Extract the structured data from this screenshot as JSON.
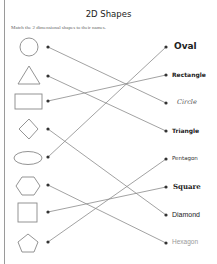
{
  "worksheet": {
    "title": "2D Shapes",
    "instructions": "Match the 2 dimensional shapes to their names."
  },
  "shapes": [
    {
      "name": "circle",
      "y": 47
    },
    {
      "name": "triangle",
      "y": 76
    },
    {
      "name": "rectangle",
      "y": 101
    },
    {
      "name": "diamond",
      "y": 129
    },
    {
      "name": "oval",
      "y": 157
    },
    {
      "name": "hexagon",
      "y": 185
    },
    {
      "name": "square",
      "y": 212
    },
    {
      "name": "pentagon",
      "y": 242
    }
  ],
  "labels": [
    {
      "text": "Oval",
      "y": 47
    },
    {
      "text": "Rectangle",
      "y": 75
    },
    {
      "text": "Circle",
      "y": 103
    },
    {
      "text": "Triangle",
      "y": 131
    },
    {
      "text": "Pentagon",
      "y": 159
    },
    {
      "text": "Square",
      "y": 187
    },
    {
      "text": "Diamond",
      "y": 215
    },
    {
      "text": "Hexagon",
      "y": 243
    }
  ],
  "connections": [
    {
      "from": "circle",
      "to": "Circle"
    },
    {
      "from": "triangle",
      "to": "Triangle"
    },
    {
      "from": "rectangle",
      "to": "Rectangle"
    },
    {
      "from": "diamond",
      "to": "Diamond"
    },
    {
      "from": "oval",
      "to": "Oval"
    },
    {
      "from": "hexagon",
      "to": "Hexagon"
    },
    {
      "from": "square",
      "to": "Square"
    },
    {
      "from": "pentagon",
      "to": "Pentagon"
    }
  ],
  "colors": {
    "line": "#8a8a8a",
    "dot": "#333333",
    "shape_stroke": "#888888"
  }
}
